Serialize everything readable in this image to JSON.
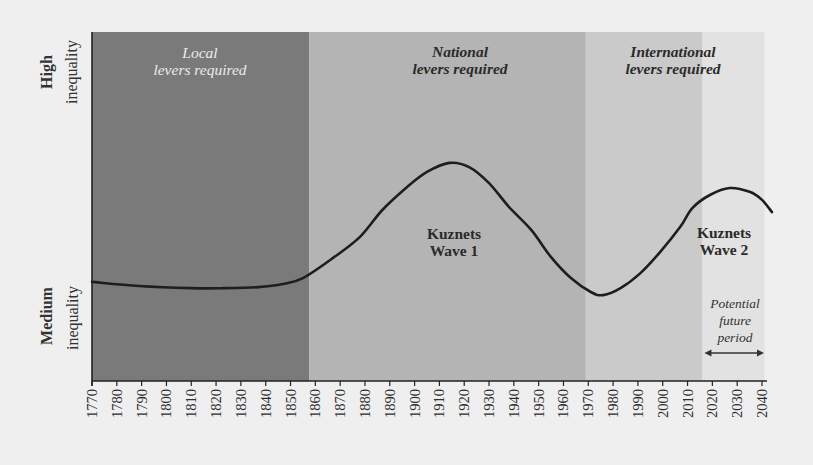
{
  "chart_data": {
    "type": "line",
    "title": "",
    "xlabel": "",
    "ylabel": "",
    "x_ticks": [
      "1770",
      "1780",
      "1790",
      "1800",
      "1810",
      "1820",
      "1830",
      "1840",
      "1850",
      "1860",
      "1870",
      "1880",
      "1890",
      "1900",
      "1910",
      "1920",
      "1930",
      "1940",
      "1950",
      "1960",
      "1970",
      "1980",
      "1990",
      "2000",
      "2010",
      "2020",
      "2030",
      "2040"
    ],
    "xlim": [
      1770,
      2040
    ],
    "ylim": [
      0,
      100
    ],
    "y_axis_labels": [
      {
        "line1": "High",
        "line2": "inequality",
        "approx_value": 88
      },
      {
        "line1": "Medium",
        "line2": "inequality",
        "approx_value": 19
      }
    ],
    "grid": false,
    "legend": null,
    "y_units": "relative inequality level (qualitative, 0 = axis baseline, 100 = top of plot)",
    "series": [
      {
        "name": "Inequality (Kuznets waves)",
        "color": "#1e1e1e",
        "points": [
          [
            1770,
            28.4
          ],
          [
            1789,
            27.2
          ],
          [
            1810,
            26.6
          ],
          [
            1823,
            26.6
          ],
          [
            1837,
            26.9
          ],
          [
            1847,
            27.8
          ],
          [
            1855,
            29.5
          ],
          [
            1867,
            35.2
          ],
          [
            1878,
            41.3
          ],
          [
            1887,
            49.0
          ],
          [
            1897,
            55.6
          ],
          [
            1905,
            59.9
          ],
          [
            1914,
            62.5
          ],
          [
            1922,
            61.3
          ],
          [
            1930,
            56.7
          ],
          [
            1938,
            49.9
          ],
          [
            1947,
            43.3
          ],
          [
            1955,
            35.5
          ],
          [
            1963,
            29.5
          ],
          [
            1971,
            25.5
          ],
          [
            1976,
            24.6
          ],
          [
            1983,
            26.6
          ],
          [
            1991,
            30.9
          ],
          [
            1999,
            37.0
          ],
          [
            2007,
            44.1
          ],
          [
            2012,
            49.6
          ],
          [
            2019,
            53.3
          ],
          [
            2027,
            55.3
          ],
          [
            2035,
            54.2
          ],
          [
            2040,
            51.9
          ],
          [
            2044,
            48.4
          ]
        ]
      }
    ],
    "bands": [
      {
        "name": "local",
        "from": 1770,
        "to": 1857.5,
        "color": "#7a7a7a",
        "line1": "Local",
        "line2": "levers required"
      },
      {
        "name": "national",
        "from": 1857.5,
        "to": 1969,
        "color": "#b4b4b4",
        "line1": "National",
        "line2": "levers required"
      },
      {
        "name": "international",
        "from": 1969,
        "to": 2016,
        "color": "#cacaca",
        "line1": "International",
        "line2": "levers required"
      },
      {
        "name": "future",
        "from": 2016,
        "to": 2041,
        "color": "#e2e2e2"
      }
    ],
    "annotations": [
      {
        "name": "kuznets-wave-1",
        "line1": "Kuznets",
        "line2": "Wave 1",
        "x": 1914,
        "y": 42
      },
      {
        "name": "kuznets-wave-2",
        "line1": "Kuznets",
        "line2": "Wave 2",
        "x": 2025,
        "y": 42
      },
      {
        "name": "potential-future-period",
        "line1": "Potential",
        "line2": "future",
        "line3": "period",
        "arrow_from": 2016,
        "arrow_to": 2040
      }
    ]
  },
  "labels": {
    "y_high_1": "High",
    "y_high_2": "inequality",
    "y_medium_1": "Medium",
    "y_medium_2": "inequality",
    "band_local_1": "Local",
    "band_local_2": "levers required",
    "band_national_1": "National",
    "band_national_2": "levers required",
    "band_international_1": "International",
    "band_international_2": "levers required",
    "wave1_1": "Kuznets",
    "wave1_2": "Wave 1",
    "wave2_1": "Kuznets",
    "wave2_2": "Wave 2",
    "future_1": "Potential",
    "future_2": "future",
    "future_3": "period"
  },
  "colors": {
    "background": "#efefef",
    "axis": "#222222",
    "curve": "#1e1e1e"
  }
}
